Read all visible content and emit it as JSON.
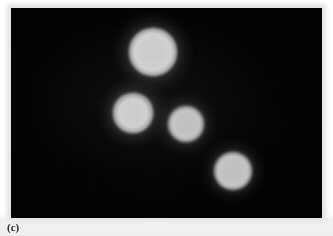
{
  "figure": {
    "panel_label": "(c)",
    "image_kind": "fluorescence-micrograph",
    "background_color": "#000000",
    "cell_color": "#c4c4c4",
    "plate": {
      "x": 11,
      "y": 8,
      "width": 311,
      "height": 210
    }
  },
  "cells": [
    {
      "name": "cell-top",
      "cx": 153,
      "cy": 52,
      "r": 24,
      "brightness": "high",
      "label": "cell 1"
    },
    {
      "name": "cell-middle-left",
      "cx": 133,
      "cy": 113,
      "r": 20,
      "brightness": "high",
      "label": "cell 2"
    },
    {
      "name": "cell-center",
      "cx": 186,
      "cy": 124,
      "r": 18,
      "brightness": "medium",
      "label": "cell 3"
    },
    {
      "name": "cell-bottom-right",
      "cx": 233,
      "cy": 171,
      "r": 19,
      "brightness": "medium",
      "label": "cell 4"
    }
  ]
}
